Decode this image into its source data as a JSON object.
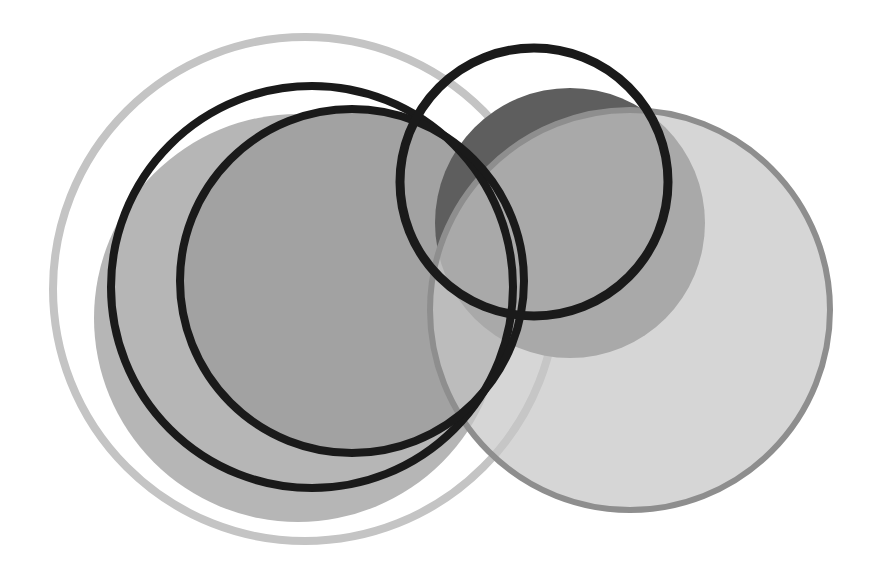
{
  "canvas": {
    "width": 876,
    "height": 573,
    "background": "#ffffff"
  },
  "shapes": [
    {
      "id": "outer-light-ring",
      "cx": 305,
      "cy": 289,
      "r": 252,
      "fill": "none",
      "stroke": "#c4c4c4",
      "stroke_width": 8,
      "opacity": 1
    },
    {
      "id": "left-gray-disc",
      "cx": 298,
      "cy": 318,
      "r": 204,
      "fill": "#b6b6b6",
      "stroke": "none",
      "stroke_width": 0,
      "opacity": 1
    },
    {
      "id": "inner-darker-disc",
      "cx": 352,
      "cy": 281,
      "r": 170,
      "fill": "#a2a2a2",
      "stroke": "none",
      "stroke_width": 0,
      "opacity": 1
    },
    {
      "id": "dark-disc",
      "cx": 570,
      "cy": 223,
      "r": 135,
      "fill": "#5e5e5e",
      "stroke": "none",
      "stroke_width": 0,
      "opacity": 1
    },
    {
      "id": "right-light-disc",
      "cx": 630,
      "cy": 310,
      "r": 200,
      "fill": "#c6c6c6",
      "stroke": "#8e8e8e",
      "stroke_width": 6,
      "opacity": 0.72
    },
    {
      "id": "black-ring-a",
      "cx": 312,
      "cy": 287,
      "r": 201,
      "fill": "none",
      "stroke": "#1a1a1a",
      "stroke_width": 8,
      "opacity": 1
    },
    {
      "id": "black-ring-b",
      "cx": 352,
      "cy": 281,
      "r": 172,
      "fill": "none",
      "stroke": "#1a1a1a",
      "stroke_width": 8,
      "opacity": 1
    },
    {
      "id": "black-ring-small",
      "cx": 534,
      "cy": 182,
      "r": 134,
      "fill": "none",
      "stroke": "#1a1a1a",
      "stroke_width": 9,
      "opacity": 1
    }
  ]
}
